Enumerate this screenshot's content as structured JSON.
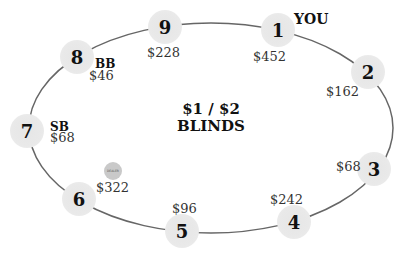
{
  "table": {
    "title_line1": "$1 / $2",
    "title_line2": "BLINDS",
    "colors": {
      "table_line": "#666666",
      "seat_fill": "#e8e8e8",
      "dealer_fill": "#c9c9c9"
    }
  },
  "seats": [
    {
      "number": "1",
      "stack": "$452",
      "tag": "YOU"
    },
    {
      "number": "2",
      "stack": "$162",
      "tag": ""
    },
    {
      "number": "3",
      "stack": "$68",
      "tag": ""
    },
    {
      "number": "4",
      "stack": "$242",
      "tag": ""
    },
    {
      "number": "5",
      "stack": "$96",
      "tag": ""
    },
    {
      "number": "6",
      "stack": "$322",
      "tag": ""
    },
    {
      "number": "7",
      "stack": "$68",
      "tag": "SB"
    },
    {
      "number": "8",
      "stack": "$46",
      "tag": "BB"
    },
    {
      "number": "9",
      "stack": "$228",
      "tag": ""
    }
  ],
  "dealer_button": {
    "label": "DEALER",
    "seat": "6"
  }
}
